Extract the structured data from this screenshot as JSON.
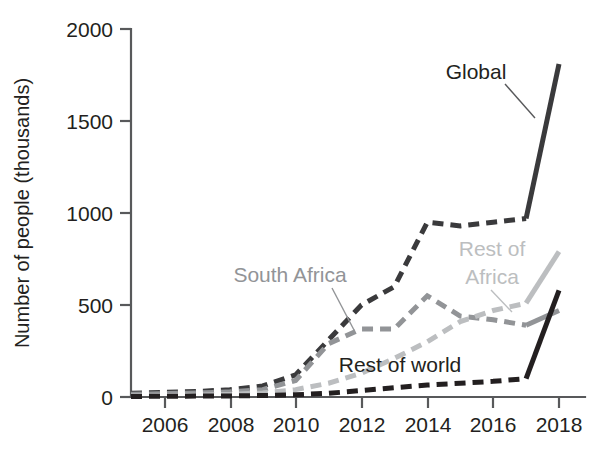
{
  "chart_data": {
    "type": "line",
    "title": "",
    "xlabel": "",
    "ylabel": "Number of people (thousands)",
    "xlim": [
      2005,
      2018
    ],
    "ylim": [
      0,
      2000
    ],
    "grid": false,
    "legend_position": "inline-annotations",
    "x": [
      2005,
      2006,
      2007,
      2008,
      2009,
      2010,
      2011,
      2012,
      2013,
      2014,
      2015,
      2016,
      2017,
      2018
    ],
    "xticks": [
      "2006",
      "2008",
      "2010",
      "2012",
      "2014",
      "2016",
      "2018"
    ],
    "xtick_values": [
      2006,
      2008,
      2010,
      2012,
      2014,
      2016,
      2018
    ],
    "yticks": [
      "0",
      "500",
      "1000",
      "1500",
      "2000"
    ],
    "ytick_values": [
      0,
      500,
      1000,
      1500,
      2000
    ],
    "series": [
      {
        "name": "Global",
        "color": "#3a3a3c",
        "style": "dashed-then-solid",
        "solid_from": 2017,
        "values": [
          20,
          25,
          30,
          40,
          60,
          120,
          310,
          500,
          600,
          950,
          930,
          950,
          970,
          1810
        ]
      },
      {
        "name": "South Africa",
        "color": "#929497",
        "style": "dashed-then-solid",
        "solid_from": 2017,
        "values": [
          15,
          18,
          22,
          28,
          40,
          90,
          290,
          370,
          370,
          550,
          440,
          420,
          390,
          470
        ]
      },
      {
        "name": "Rest of Africa",
        "color": "#bcbec0",
        "style": "dashed-then-solid",
        "solid_from": 2017,
        "values": [
          5,
          8,
          10,
          14,
          22,
          40,
          75,
          130,
          210,
          300,
          410,
          470,
          510,
          790
        ]
      },
      {
        "name": "Rest of world",
        "color": "#231f20",
        "style": "dashed-then-solid",
        "solid_from": 2017,
        "values": [
          3,
          4,
          5,
          6,
          8,
          12,
          20,
          35,
          50,
          65,
          75,
          85,
          100,
          580
        ]
      }
    ],
    "annotations": [
      {
        "text": "Global",
        "color": "#231f20"
      },
      {
        "text": "South Africa",
        "color": "#929497"
      },
      {
        "text": "Rest of",
        "color": "#bcbec0"
      },
      {
        "text": "Africa",
        "color": "#bcbec0"
      },
      {
        "text": "Rest of world",
        "color": "#231f20"
      }
    ]
  },
  "axis": {
    "y_title": "Number of people (thousands)",
    "y_labels": [
      "2000",
      "1500",
      "1000",
      "500",
      "0"
    ],
    "x_labels": [
      "2006",
      "2008",
      "2010",
      "2012",
      "2014",
      "2016",
      "2018"
    ]
  },
  "labels": {
    "global": "Global",
    "south_africa": "South Africa",
    "rest_of_africa_line1": "Rest of",
    "rest_of_africa_line2": "Africa",
    "rest_of_world": "Rest of world"
  },
  "colors": {
    "global": "#3a3a3c",
    "south_africa": "#929497",
    "rest_of_africa": "#bcbec0",
    "rest_of_world": "#231f20",
    "axis": "#58595b",
    "text": "#231f20"
  }
}
